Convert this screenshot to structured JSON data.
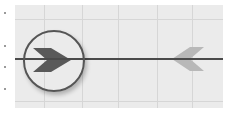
{
  "diagram": {
    "colors": {
      "background": "#ffffff",
      "panel": "#ebebeb",
      "grid": "#d6d6d6",
      "track": "#4a4a4a",
      "ring": "#555555",
      "active_chevron": "#595959",
      "faded_chevron": "#b8b8b8"
    },
    "grid": {
      "vertical_lines_x": [
        29,
        67,
        103,
        142,
        177
      ],
      "horizontal_lines_y": [
        14,
        96
      ]
    },
    "track": {
      "y": 53
    },
    "markers": [
      {
        "name": "active-marker",
        "direction": "right",
        "state": "selected",
        "circled": true
      },
      {
        "name": "inactive-marker",
        "direction": "left",
        "state": "faded",
        "circled": false
      }
    ]
  }
}
